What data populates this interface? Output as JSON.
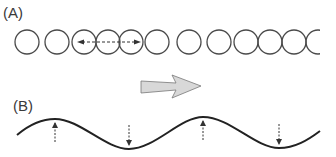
{
  "panels": {
    "a": {
      "label": "(A)",
      "description": "Row of particles (circles) with compression and rarefaction; dashed double-headed arrow shows longitudinal displacement"
    },
    "b": {
      "label": "(B)",
      "description": "Transverse wave; dashed arrows show particle displacement up at crests and down at troughs"
    }
  },
  "arrow": {
    "direction": "right",
    "meaning": "direction of wave propagation"
  },
  "circles": [
    {
      "cx": 27
    },
    {
      "cx": 57
    },
    {
      "cx": 84
    },
    {
      "cx": 108
    },
    {
      "cx": 131
    },
    {
      "cx": 157
    },
    {
      "cx": 189
    },
    {
      "cx": 219
    },
    {
      "cx": 246
    },
    {
      "cx": 270
    },
    {
      "cx": 294
    },
    {
      "cx": 318
    }
  ],
  "colors": {
    "stroke": "#4a4a4a",
    "wave": "#222222",
    "arrow_fill": "#d8d8d8"
  }
}
